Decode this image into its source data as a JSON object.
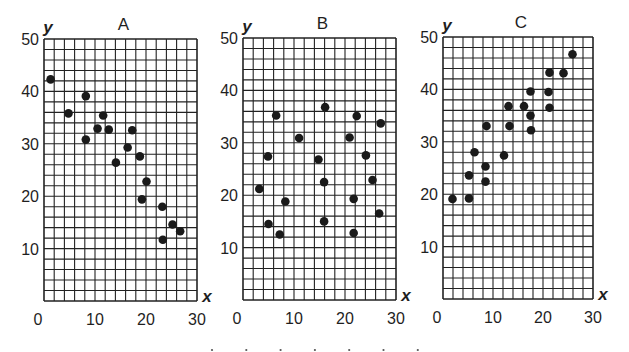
{
  "figure": {
    "panel_count": 3,
    "bottom_marks": 7
  },
  "chart_data": [
    {
      "type": "scatter",
      "title": "A",
      "xlabel": "x",
      "ylabel": "y",
      "xlim": [
        0,
        30
      ],
      "ylim": [
        0,
        50
      ],
      "xticks": [
        "0",
        "10",
        "20",
        "30"
      ],
      "yticks": [
        "10",
        "20",
        "30",
        "40",
        "50"
      ],
      "grid": true,
      "grid_step": 2,
      "correlation": "negative",
      "points": [
        [
          1.3,
          42.3
        ],
        [
          4.8,
          35.8
        ],
        [
          8.2,
          39.1
        ],
        [
          8.2,
          30.8
        ],
        [
          10.5,
          32.9
        ],
        [
          11.6,
          35.4
        ],
        [
          12.7,
          32.7
        ],
        [
          14.1,
          26.4
        ],
        [
          16.4,
          29.3
        ],
        [
          17.3,
          32.6
        ],
        [
          18.8,
          27.6
        ],
        [
          20.1,
          22.8
        ],
        [
          19.2,
          19.4
        ],
        [
          23.2,
          18.0
        ],
        [
          25.2,
          14.6
        ],
        [
          26.7,
          13.3
        ],
        [
          23.3,
          11.7
        ]
      ]
    },
    {
      "type": "scatter",
      "title": "B",
      "xlabel": "x",
      "ylabel": "y",
      "xlim": [
        0,
        30
      ],
      "ylim": [
        0,
        50
      ],
      "xticks": [
        "0",
        "10",
        "20",
        "30"
      ],
      "yticks": [
        "10",
        "20",
        "30",
        "40",
        "50"
      ],
      "grid": true,
      "grid_step": 2,
      "correlation": "none",
      "points": [
        [
          3.2,
          21.2
        ],
        [
          4.9,
          27.4
        ],
        [
          6.5,
          35.2
        ],
        [
          5.0,
          14.5
        ],
        [
          7.2,
          12.5
        ],
        [
          8.3,
          18.8
        ],
        [
          11.0,
          30.9
        ],
        [
          14.8,
          26.8
        ],
        [
          16.1,
          36.8
        ],
        [
          15.9,
          22.5
        ],
        [
          15.9,
          15.0
        ],
        [
          20.9,
          31.0
        ],
        [
          22.3,
          35.1
        ],
        [
          21.7,
          19.3
        ],
        [
          21.7,
          12.8
        ],
        [
          24.1,
          27.6
        ],
        [
          25.4,
          22.9
        ],
        [
          27.0,
          33.7
        ],
        [
          26.7,
          16.5
        ]
      ]
    },
    {
      "type": "scatter",
      "title": "C",
      "xlabel": "x",
      "ylabel": "y",
      "xlim": [
        0,
        30
      ],
      "ylim": [
        0,
        50
      ],
      "xticks": [
        "0",
        "10",
        "20",
        "30"
      ],
      "yticks": [
        "10",
        "20",
        "30",
        "40",
        "50"
      ],
      "grid": true,
      "grid_step": 2,
      "correlation": "positive",
      "points": [
        [
          1.9,
          19.1
        ],
        [
          5.2,
          19.2
        ],
        [
          5.2,
          23.6
        ],
        [
          6.3,
          28.0
        ],
        [
          8.5,
          25.3
        ],
        [
          8.5,
          22.4
        ],
        [
          8.7,
          33.0
        ],
        [
          12.2,
          27.4
        ],
        [
          13.1,
          36.8
        ],
        [
          13.3,
          33.0
        ],
        [
          16.2,
          36.8
        ],
        [
          17.5,
          39.6
        ],
        [
          17.5,
          35.0
        ],
        [
          17.6,
          32.2
        ],
        [
          21.3,
          43.2
        ],
        [
          21.1,
          39.5
        ],
        [
          21.3,
          36.5
        ],
        [
          24.1,
          43.1
        ],
        [
          25.9,
          46.7
        ]
      ]
    }
  ]
}
